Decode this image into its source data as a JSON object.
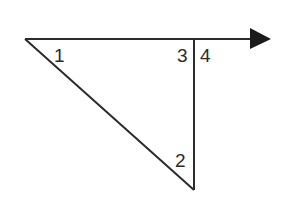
{
  "diagram": {
    "stroke_color": "#2b2b2b",
    "background": "#ffffff",
    "points": {
      "A": {
        "x": 25,
        "y": 39
      },
      "B": {
        "x": 194,
        "y": 39
      },
      "C": {
        "x": 194,
        "y": 190
      },
      "arrow_tip": {
        "x": 271,
        "y": 39
      }
    },
    "angles": [
      {
        "label": "1",
        "x": 54,
        "y": 62
      },
      {
        "label": "2",
        "x": 175,
        "y": 167
      },
      {
        "label": "3",
        "x": 177,
        "y": 62
      },
      {
        "label": "4",
        "x": 200,
        "y": 62
      }
    ]
  }
}
